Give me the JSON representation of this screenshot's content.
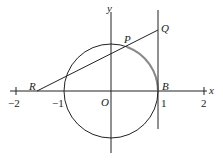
{
  "diagram": {
    "axes": {
      "x_label": "x",
      "y_label": "y",
      "x_ticks": [
        "−2",
        "−1",
        "1",
        "2"
      ],
      "origin_label": "O"
    },
    "points": {
      "P": "P",
      "Q": "Q",
      "R": "R",
      "B": "B"
    },
    "elements": [
      "unit circle centered at O",
      "vertical tangent line x = 1 through B",
      "line from R through P to Q",
      "highlighted arc from P to B"
    ],
    "colors": {
      "line": "#222222",
      "arc_highlight": "#8a8a8a"
    }
  }
}
